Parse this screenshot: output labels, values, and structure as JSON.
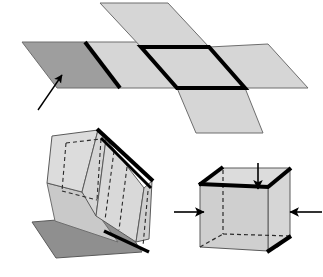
{
  "figure": {
    "title": "Folding a paper net into a cube",
    "width": 323,
    "height": 277,
    "background": "#ffffff"
  },
  "colors": {
    "light_gray": "#d6d6d6",
    "mid_gray": "#c9c9c9",
    "dark_gray": "#9e9e9e",
    "darker_gray": "#8f8f8f",
    "shadow_gray": "#b5b5b5",
    "outline": "#6e6e6e",
    "bold_stroke": "#000000",
    "dashed_stroke": "#333333",
    "arrow": "#000000"
  },
  "panels": [
    {
      "id": "net",
      "name": "flat-net-panel",
      "caption": "Flat net of two crossing strips of parallelograms",
      "faces": [
        {
          "name": "net-face-left-dark",
          "fill": "dark_gray",
          "points": "22,42 85,42 120,88 57,88"
        },
        {
          "name": "net-face-left-mid",
          "fill": "light_gray",
          "points": "85,42 150,42 185,88 120,88"
        },
        {
          "name": "net-face-top",
          "fill": "light_gray",
          "points": "100,3 168,3 209,47 141,47"
        },
        {
          "name": "net-face-center",
          "fill": "light_gray",
          "points": "141,47 209,47 245,88 177,88"
        },
        {
          "name": "net-face-right",
          "fill": "light_gray",
          "points": "209,47 268,44 308,88 245,88"
        },
        {
          "name": "net-face-bottom",
          "fill": "light_gray",
          "points": "177,88 245,88 263,133 196,133"
        }
      ],
      "bold_edges": [
        {
          "name": "bold-edge-left-fold",
          "points": "85,42 120,88"
        },
        {
          "name": "bold-edge-center-top",
          "points": "141,47 209,47"
        },
        {
          "name": "bold-edge-center-left",
          "points": "141,47 177,88"
        },
        {
          "name": "bold-edge-center-bottom",
          "points": "177,88 245,88"
        },
        {
          "name": "bold-edge-center-right",
          "points": "209,47 245,88"
        }
      ],
      "arrow": {
        "name": "net-pointer-arrow",
        "label": "pointer to shaded face",
        "from": "38,110",
        "to": "61,74"
      }
    },
    {
      "id": "partial-fold",
      "name": "partially-folded-panel",
      "caption": "Partially folded paper with hidden fold lines dashed",
      "faces": [
        {
          "name": "fold-face-left-flap",
          "fill": "light_gray",
          "points": "52,136 98,130 82,192 47,183"
        },
        {
          "name": "fold-face-left-under",
          "fill": "mid_gray",
          "points": "47,183 82,192 118,242 55,221"
        },
        {
          "name": "fold-face-front-left",
          "fill": "light_gray",
          "points": "98,130 104,138 95,215 82,192"
        },
        {
          "name": "fold-face-front-mid",
          "fill": "light_gray",
          "points": "104,138 143,188 135,241 95,215"
        },
        {
          "name": "fold-face-front-right",
          "fill": "light_gray",
          "points": "143,188 152,180 148,238 135,241"
        },
        {
          "name": "fold-face-bottom-flap",
          "fill": "darker_gray",
          "points": "32,222 118,215 142,252 56,258"
        }
      ],
      "bold_edges": [
        {
          "name": "fold-bold-ridge-top",
          "points": "98,130 152,180"
        },
        {
          "name": "fold-bold-ridge-inner",
          "points": "100,136 150,186"
        },
        {
          "name": "fold-bold-lower-edge",
          "points": "105,232 148,251"
        }
      ],
      "thin_edges": [
        {
          "name": "fold-edge-left-outer",
          "points": "52,136 47,183"
        },
        {
          "name": "fold-edge-left-bottom",
          "points": "47,183 82,192"
        },
        {
          "name": "fold-edge-left-top",
          "points": "52,136 98,130"
        },
        {
          "name": "fold-edge-under-left",
          "points": "47,183 55,221"
        },
        {
          "name": "fold-edge-under-bottom",
          "points": "55,221 118,242"
        },
        {
          "name": "fold-edge-front-crease",
          "points": "104,138 95,215"
        },
        {
          "name": "fold-edge-front-right-crease",
          "points": "143,188 135,241"
        },
        {
          "name": "fold-edge-far-right",
          "points": "152,180 148,238"
        },
        {
          "name": "fold-edge-front-bottom",
          "points": "95,215 135,241"
        }
      ],
      "dashed_edges": [
        {
          "name": "fold-dash-left-vert-a",
          "points": "66,143 62,190"
        },
        {
          "name": "fold-dash-left-vert-b",
          "points": "100,138 96,199"
        },
        {
          "name": "fold-dash-left-horiz",
          "points": "62,190 96,199"
        },
        {
          "name": "fold-dash-left-top",
          "points": "66,143 100,138"
        },
        {
          "name": "fold-dash-mid-vert-a",
          "points": "113,150 104,219"
        },
        {
          "name": "fold-dash-mid-vert-b",
          "points": "126,166 118,229"
        },
        {
          "name": "fold-dash-right-vert",
          "points": "147,190 142,245"
        }
      ]
    },
    {
      "id": "cube",
      "name": "finished-cube-panel",
      "caption": "Finished cube with arrows showing closing pressure",
      "faces": [
        {
          "name": "cube-face-top",
          "fill": "light_gray",
          "points": "200,184 223,168 290,168 268,186"
        },
        {
          "name": "cube-face-front-left",
          "fill": "mid_gray",
          "points": "200,184 268,186 268,251 200,247"
        },
        {
          "name": "cube-face-right",
          "fill": "light_gray",
          "points": "268,186 290,168 290,236 268,251"
        },
        {
          "name": "cube-face-bottom-shadow",
          "fill": "darker_gray",
          "points": "213,243 278,246 290,236 223,234"
        }
      ],
      "bold_edges": [
        {
          "name": "cube-bold-top-left",
          "points": "200,184 223,168"
        },
        {
          "name": "cube-bold-top-front",
          "points": "200,184 268,186"
        },
        {
          "name": "cube-bold-top-right",
          "points": "268,186 290,168"
        },
        {
          "name": "cube-bold-bottom-right",
          "points": "268,251 290,236"
        }
      ],
      "thin_edges": [
        {
          "name": "cube-edge-top-back",
          "points": "223,168 290,168"
        },
        {
          "name": "cube-edge-left-vert",
          "points": "200,184 200,247"
        },
        {
          "name": "cube-edge-front-vert",
          "points": "268,186 268,251"
        },
        {
          "name": "cube-edge-right-vert",
          "points": "290,168 290,236"
        },
        {
          "name": "cube-edge-front-bottom",
          "points": "200,247 268,251"
        }
      ],
      "dashed_edges": [
        {
          "name": "cube-dash-back-vert",
          "points": "223,168 223,234"
        },
        {
          "name": "cube-dash-back-bottom-left",
          "points": "200,247 223,234"
        },
        {
          "name": "cube-dash-back-bottom-right",
          "points": "223,234 290,236"
        }
      ],
      "arrows": [
        {
          "name": "cube-arrow-top",
          "direction": "down",
          "from": "258,164",
          "to": "258,188"
        },
        {
          "name": "cube-arrow-left",
          "direction": "right",
          "from": "175,212",
          "to": "203,212"
        },
        {
          "name": "cube-arrow-right",
          "direction": "left",
          "from": "322,212",
          "to": "291,212"
        }
      ]
    }
  ]
}
